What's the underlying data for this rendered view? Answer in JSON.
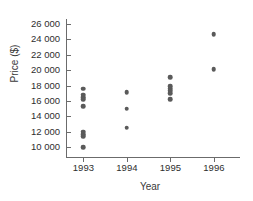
{
  "chart_data": {
    "type": "scatter",
    "title": "",
    "xlabel": "Year",
    "ylabel": "Price ($)",
    "xlim": [
      1992.6,
      1996.6
    ],
    "ylim": [
      9200,
      26400
    ],
    "grid": false,
    "legend": "none",
    "marker_color": "#5a5a5a",
    "axis_color": "#6b6b6b",
    "x_tick_labels": [
      "1993",
      "1994",
      "1995",
      "1996"
    ],
    "x_ticks": [
      1993,
      1994,
      1995,
      1996
    ],
    "y_tick_labels": [
      "10 000",
      "12 000",
      "14 000",
      "16 000",
      "18 000",
      "20 000",
      "22 000",
      "24 000",
      "26 000"
    ],
    "y_ticks": [
      10000,
      12000,
      14000,
      16000,
      18000,
      20000,
      22000,
      24000,
      26000
    ],
    "points": [
      {
        "x": 1993,
        "y": 17600
      },
      {
        "x": 1993,
        "y": 16800
      },
      {
        "x": 1993,
        "y": 16500
      },
      {
        "x": 1993,
        "y": 16200
      },
      {
        "x": 1993,
        "y": 15300
      },
      {
        "x": 1993,
        "y": 12000
      },
      {
        "x": 1993,
        "y": 11700
      },
      {
        "x": 1993,
        "y": 11400
      },
      {
        "x": 1993,
        "y": 10000
      },
      {
        "x": 1994,
        "y": 17100
      },
      {
        "x": 1994,
        "y": 15000
      },
      {
        "x": 1994,
        "y": 12500
      },
      {
        "x": 1995,
        "y": 19100
      },
      {
        "x": 1995,
        "y": 17900
      },
      {
        "x": 1995,
        "y": 17600
      },
      {
        "x": 1995,
        "y": 17300
      },
      {
        "x": 1995,
        "y": 17000
      },
      {
        "x": 1995,
        "y": 16200
      },
      {
        "x": 1996,
        "y": 24700
      },
      {
        "x": 1996,
        "y": 20100
      }
    ]
  }
}
